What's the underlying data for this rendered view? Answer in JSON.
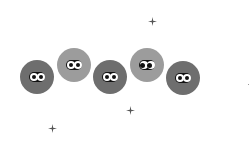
{
  "scene": {
    "background": "#ffffff",
    "creatures": [
      {
        "id": "creature-1",
        "x": 20,
        "y": 60,
        "shade": "dark",
        "color": "#6e6e6e",
        "gaze": "center"
      },
      {
        "id": "creature-2",
        "x": 57,
        "y": 48,
        "shade": "light",
        "color": "#9c9c9c",
        "gaze": "center"
      },
      {
        "id": "creature-3",
        "x": 93,
        "y": 60,
        "shade": "dark",
        "color": "#6e6e6e",
        "gaze": "center"
      },
      {
        "id": "creature-4",
        "x": 130,
        "y": 48,
        "shade": "light",
        "color": "#9c9c9c",
        "gaze": "left"
      },
      {
        "id": "creature-5",
        "x": 166,
        "y": 61,
        "shade": "dark",
        "color": "#6e6e6e",
        "gaze": "center"
      }
    ],
    "sparkles": [
      {
        "id": "sparkle-1",
        "x": 148,
        "y": 17
      },
      {
        "id": "sparkle-2",
        "x": 126,
        "y": 106
      },
      {
        "id": "sparkle-3",
        "x": 48,
        "y": 124
      }
    ],
    "dots": [
      {
        "id": "dot-1",
        "x": 248,
        "y": 84
      }
    ]
  }
}
